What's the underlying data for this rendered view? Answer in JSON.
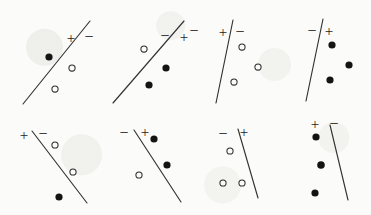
{
  "figure": {
    "caption": "",
    "background_color": "#fbfbf9",
    "ink_color": "#1d1d1d",
    "marker_filled_color": "#141414",
    "marker_open_fill": "#fbfbf9",
    "marker_open_stroke": "#2b2b2b",
    "panel_count": 8,
    "rows": 2,
    "columns": 4,
    "label_positive": "+",
    "label_negative": "−"
  },
  "panels": [
    {
      "id": "panel-1",
      "row": 1,
      "column": 1,
      "line": {
        "x1": 23,
        "y1": 104,
        "x2": 90,
        "y2": 21
      },
      "labels": [
        {
          "text": "+",
          "kind": "positive",
          "x": 71,
          "y": 38
        },
        {
          "text": "−",
          "kind": "negative",
          "x": 89,
          "y": 37
        }
      ],
      "points": [
        {
          "kind": "filled",
          "x": 49,
          "y": 57,
          "r": 3.6
        },
        {
          "kind": "open",
          "x": 72,
          "y": 68,
          "r": 3.1
        },
        {
          "kind": "open",
          "x": 55,
          "y": 89,
          "r": 3.1
        }
      ]
    },
    {
      "id": "panel-2",
      "row": 1,
      "column": 2,
      "line": {
        "x1": 113,
        "y1": 103,
        "x2": 184,
        "y2": 21
      },
      "labels": [
        {
          "text": "−",
          "kind": "negative",
          "x": 165,
          "y": 36
        },
        {
          "text": "+",
          "kind": "positive",
          "x": 184,
          "y": 37
        }
      ],
      "points": [
        {
          "kind": "open",
          "x": 144,
          "y": 49,
          "r": 3.1
        },
        {
          "kind": "filled",
          "x": 166,
          "y": 68,
          "r": 3.6
        },
        {
          "kind": "filled",
          "x": 149,
          "y": 85,
          "r": 3.6
        }
      ]
    },
    {
      "id": "panel-3",
      "row": 1,
      "column": 3,
      "line": {
        "x1": 216,
        "y1": 103,
        "x2": 233,
        "y2": 20
      },
      "labels": [
        {
          "text": "+",
          "kind": "positive",
          "x": 223,
          "y": 32
        },
        {
          "text": "−",
          "kind": "negative",
          "x": 240,
          "y": 32
        }
      ],
      "points": [
        {
          "kind": "open",
          "x": 242,
          "y": 47,
          "r": 3.1
        },
        {
          "kind": "open",
          "x": 258,
          "y": 67,
          "r": 3.1
        },
        {
          "kind": "open",
          "x": 234,
          "y": 82,
          "r": 3.1
        }
      ]
    },
    {
      "id": "panel-4",
      "row": 1,
      "column": 4,
      "line": {
        "x1": 306,
        "y1": 101,
        "x2": 323,
        "y2": 19
      },
      "labels": [
        {
          "text": "−",
          "kind": "negative",
          "x": 312,
          "y": 31
        },
        {
          "text": "+",
          "kind": "positive",
          "x": 329,
          "y": 31
        },
        {
          "text": "−",
          "kind": "negative",
          "x": 194,
          "y": 31
        }
      ],
      "points": [
        {
          "kind": "filled",
          "x": 332,
          "y": 45,
          "r": 3.6
        },
        {
          "kind": "filled",
          "x": 349,
          "y": 65,
          "r": 3.6
        },
        {
          "kind": "filled",
          "x": 330,
          "y": 80,
          "r": 3.6
        }
      ]
    },
    {
      "id": "panel-5",
      "row": 2,
      "column": 1,
      "line": {
        "x1": 32,
        "y1": 131,
        "x2": 87,
        "y2": 203
      },
      "labels": [
        {
          "text": "+",
          "kind": "positive",
          "x": 24,
          "y": 135
        },
        {
          "text": "−",
          "kind": "negative",
          "x": 43,
          "y": 134
        }
      ],
      "points": [
        {
          "kind": "open",
          "x": 55,
          "y": 145,
          "r": 3.1
        },
        {
          "kind": "open",
          "x": 73,
          "y": 172,
          "r": 3.1
        },
        {
          "kind": "filled",
          "x": 59,
          "y": 197,
          "r": 3.6
        }
      ]
    },
    {
      "id": "panel-6",
      "row": 2,
      "column": 2,
      "line": {
        "x1": 134,
        "y1": 130,
        "x2": 181,
        "y2": 202
      },
      "labels": [
        {
          "text": "−",
          "kind": "negative",
          "x": 124,
          "y": 133
        },
        {
          "text": "+",
          "kind": "positive",
          "x": 145,
          "y": 132
        }
      ],
      "points": [
        {
          "kind": "filled",
          "x": 154,
          "y": 139,
          "r": 3.6
        },
        {
          "kind": "filled",
          "x": 167,
          "y": 165,
          "r": 3.6
        },
        {
          "kind": "open",
          "x": 139,
          "y": 175,
          "r": 3.1
        }
      ]
    },
    {
      "id": "panel-7",
      "row": 2,
      "column": 3,
      "line": {
        "x1": 238,
        "y1": 129,
        "x2": 258,
        "y2": 198
      },
      "labels": [
        {
          "text": "−",
          "kind": "negative",
          "x": 223,
          "y": 134
        },
        {
          "text": "+",
          "kind": "positive",
          "x": 244,
          "y": 132
        }
      ],
      "points": [
        {
          "kind": "open",
          "x": 230,
          "y": 151,
          "r": 3.1
        },
        {
          "kind": "open",
          "x": 223,
          "y": 183,
          "r": 3.1
        },
        {
          "kind": "open",
          "x": 242,
          "y": 183,
          "r": 3.1
        }
      ]
    },
    {
      "id": "panel-8",
      "row": 2,
      "column": 4,
      "line": {
        "x1": 330,
        "y1": 125,
        "x2": 348,
        "y2": 200
      },
      "labels": [
        {
          "text": "+",
          "kind": "positive",
          "x": 315,
          "y": 124
        },
        {
          "text": "−",
          "kind": "negative",
          "x": 334,
          "y": 124
        }
      ],
      "points": [
        {
          "kind": "filled",
          "x": 316,
          "y": 137,
          "r": 3.6
        },
        {
          "kind": "filled",
          "x": 321,
          "y": 165,
          "r": 3.8
        },
        {
          "kind": "filled",
          "x": 315,
          "y": 193,
          "r": 3.6
        }
      ]
    }
  ]
}
